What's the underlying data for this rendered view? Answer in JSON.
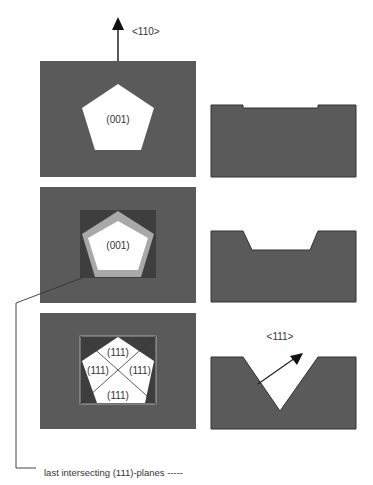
{
  "colors": {
    "substrate": "#5a5a5a",
    "mask_window": "#3e3e3e",
    "etched_light": "#a8a8a8",
    "open": "#ffffff",
    "line": "#222222"
  },
  "labels": {
    "direction_110": "<110>",
    "plane_001_top": "(001)",
    "plane_001_mid": "(001)",
    "plane_111_top": "(111)",
    "plane_111_left": "(111)",
    "plane_111_right": "(111)",
    "plane_111_bottom": "(111)",
    "direction_111": "<111>"
  },
  "caption": "last intersecting (111)-planes -----"
}
